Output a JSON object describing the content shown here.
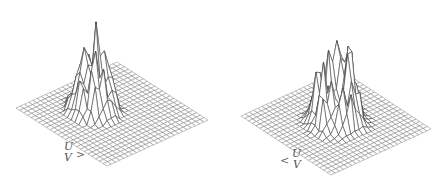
{
  "figure": {
    "type": "3d-wireframe-surface-pair",
    "background": "#ffffff",
    "line_color": "#444444",
    "grid_color": "#777777",
    "grid_divisions": 24,
    "panels": [
      {
        "id": "left",
        "axis_labels": {
          "u": "U",
          "v": "V"
        },
        "arrow": ">",
        "base": {
          "left": [
            16,
            108
          ],
          "top": [
            117,
            62
          ],
          "right": [
            207,
            117
          ],
          "bottom": [
            107,
            166
          ]
        },
        "description": "Tall clustered spiky peaks centered on the back half of the grid"
      },
      {
        "id": "right",
        "axis_labels": {
          "u": "U",
          "v": "V"
        },
        "arrow": "<",
        "base": {
          "left": [
            241,
            116
          ],
          "top": [
            341,
            70
          ],
          "right": [
            431,
            124
          ],
          "bottom": [
            331,
            175
          ]
        },
        "description": "Ring-like cluster of spiky peaks around the grid center"
      }
    ]
  }
}
